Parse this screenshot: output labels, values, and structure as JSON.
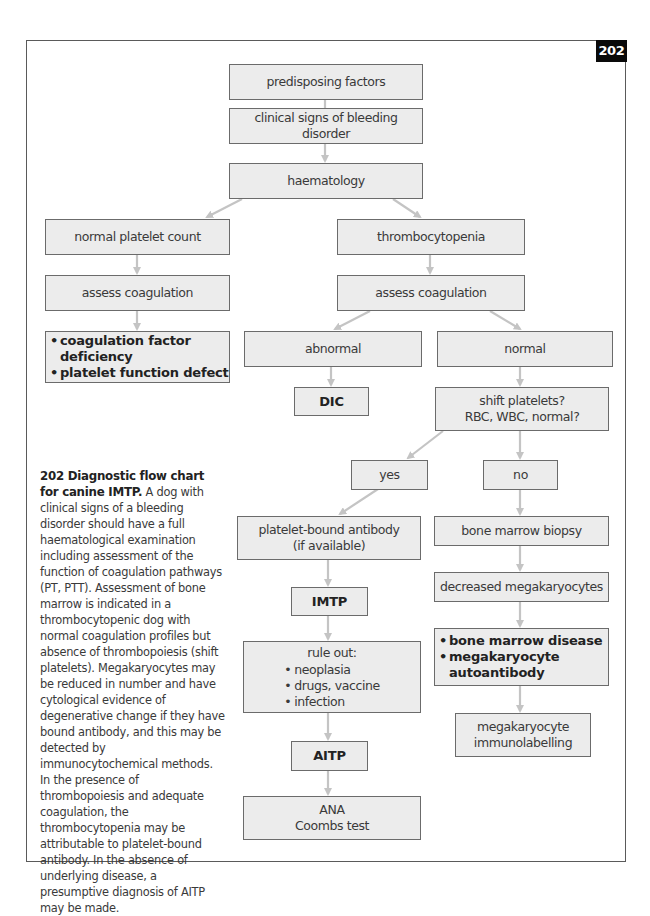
{
  "figure": {
    "number": "202",
    "badge_color": "#0a0a0a",
    "box_fill": "#ececec",
    "arrow_color": "#c4c4c4"
  },
  "flowchart": {
    "nodes": {
      "predisposing": "predisposing factors",
      "clinical_signs": "clinical signs of bleeding disorder",
      "haematology": "haematology",
      "normal_platelet": "normal platelet count",
      "thrombocytopenia": "thrombocytopenia",
      "assess_left": "assess coagulation",
      "assess_right": "assess coagulation",
      "coag_results": [
        "coagulation factor deficiency",
        "platelet function defect"
      ],
      "abnormal": "abnormal",
      "normal": "normal",
      "dic": "DIC",
      "shift_platelets": [
        "shift platelets?",
        "RBC, WBC, normal?"
      ],
      "yes": "yes",
      "no": "no",
      "platelet_antibody": [
        "platelet-bound antibody",
        "(if available)"
      ],
      "bone_marrow_biopsy": "bone marrow biopsy",
      "imtp": "IMTP",
      "decreased_mega": "decreased megakaryocytes",
      "rule_out": {
        "title": "rule out:",
        "items": [
          "neoplasia",
          "drugs, vaccine",
          "infection"
        ]
      },
      "bm_results": [
        "bone marrow disease",
        "megakaryocyte",
        "autoantibody"
      ],
      "mega_immuno": [
        "megakaryocyte",
        "immunolabelling"
      ],
      "aitp": "AITP",
      "ana_coombs": [
        "ANA",
        "Coombs test"
      ]
    },
    "bullet": "•"
  },
  "caption": {
    "lead": "202 Diagnostic flow chart for canine IMTP.",
    "body": " A dog with clinical signs of a bleeding disorder should have a full haematological examination including assessment of the function of coagulation pathways (PT, PTT). Assessment of bone marrow is indicated in a thrombocytopenic dog with normal coagulation profiles but absence of thrombopoiesis (shift platelets). Megakaryocytes may be reduced in number and have cytological evidence of degenerative change if they have bound antibody, and this may be detected by immunocytochemical methods. In the presence of thrombopoiesis and adequate coagulation, the thrombocytopenia may be attributable to platelet-bound antibody. In the absence of underlying disease, a presumptive diagnosis of AITP may be made."
  }
}
